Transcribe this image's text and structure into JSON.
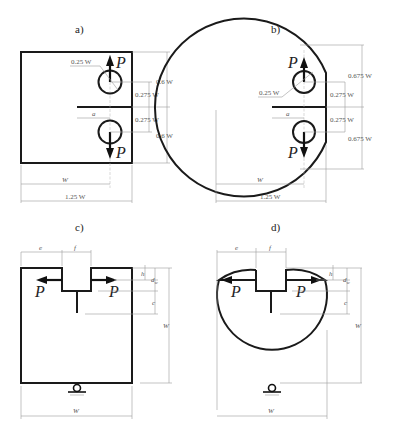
{
  "figure": {
    "panels": [
      {
        "id": "a",
        "label": "a)",
        "shape": "compact-tension",
        "force_top": "P",
        "force_bottom": "P",
        "dims": {
          "hole_diameter": "0.25 W",
          "top_height": "0.6 W",
          "hole_offset_top": "0.275 W",
          "hole_offset_bottom": "0.275 W",
          "bottom_height": "0.6 W",
          "crack_length": "a",
          "width_to_load_line": "W",
          "total_width": "1.25 W"
        }
      },
      {
        "id": "b",
        "label": "b)",
        "shape": "disk-shaped-compact-tension",
        "force_top": "P",
        "force_bottom": "P",
        "dims": {
          "hole_diameter": "0.25 W",
          "top_height": "0.675 W",
          "hole_offset_top": "0.275 W",
          "hole_offset_bottom": "0.275 W",
          "bottom_height": "0.675 W",
          "crack_length": "a",
          "width_to_load_line": "W",
          "total_width": "1.25 W"
        }
      },
      {
        "id": "c",
        "label": "c)",
        "shape": "wedge-splitting-cube",
        "force_left": "P",
        "force_right": "P",
        "dims": {
          "e": "e",
          "f": "f",
          "h": "h",
          "dw": "d",
          "dw_sub": "w",
          "c": "c",
          "height": "W",
          "width": "W"
        }
      },
      {
        "id": "d",
        "label": "d)",
        "shape": "wedge-splitting-cylinder",
        "force_left": "P",
        "force_right": "P",
        "dims": {
          "e": "e",
          "f": "f",
          "h": "h",
          "dw": "d",
          "dw_sub": "w",
          "c": "c",
          "height": "W",
          "width": "W"
        }
      }
    ]
  }
}
